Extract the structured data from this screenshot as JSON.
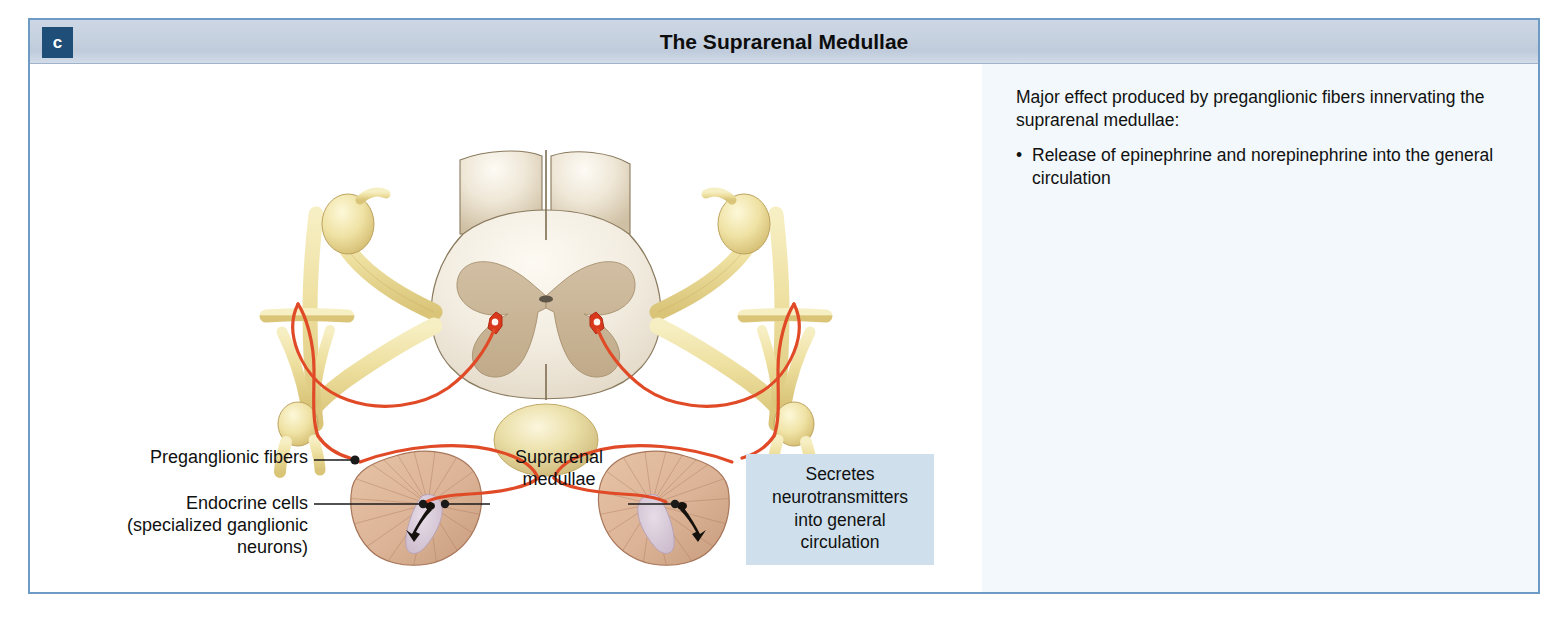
{
  "figure": {
    "badge": "c",
    "title": "The Suprarenal Medullae"
  },
  "notes": {
    "intro": "Major effect produced by preganglionic fibers innervating the suprarenal medullae:",
    "bullets": [
      "Release of epinephrine and norepinephrine into the general circulation"
    ]
  },
  "illustration": {
    "labels": {
      "preganglionic_fibers": "Preganglionic fibers",
      "endocrine_cells": "Endocrine cells (specialized ganglionic neurons)",
      "endocrine_cells_line1": "Endocrine cells",
      "endocrine_cells_line2": "(specialized ganglionic",
      "endocrine_cells_line3": "neurons)",
      "suprarenal_medullae_line1": "Suprarenal",
      "suprarenal_medullae_line2": "medullae"
    },
    "callout": {
      "line1": "Secretes",
      "line2": "neurotransmitters",
      "line3": "into general",
      "line4": "circulation"
    },
    "structures": [
      "spinal-cord-cross-section",
      "gray-matter-butterfly",
      "preganglionic-neuron-cell-body-left",
      "preganglionic-neuron-cell-body-right",
      "sympathetic-chain-ganglion-left",
      "sympathetic-chain-ganglion-right",
      "spinal-nerve-left",
      "spinal-nerve-right",
      "celiac-ganglion",
      "suprarenal-gland-left",
      "suprarenal-gland-right",
      "suprarenal-medulla-left",
      "suprarenal-medulla-right"
    ]
  },
  "colors": {
    "frame_border": "#6d9bc6",
    "header_bar": "#c7d2e0",
    "badge_background": "#1f4e79",
    "notes_panel_background": "#f2f8fb",
    "callout_background": "#cfe0ec",
    "preganglionic_fiber": "#e04a27",
    "nerve_yellow": "#ece0a6",
    "cord_white_matter": "#f1ece1",
    "cord_gray_matter": "#cbb79a",
    "gland_cortex": "#dcb396",
    "gland_medulla": "#d8cbd8",
    "text": "#111111"
  }
}
